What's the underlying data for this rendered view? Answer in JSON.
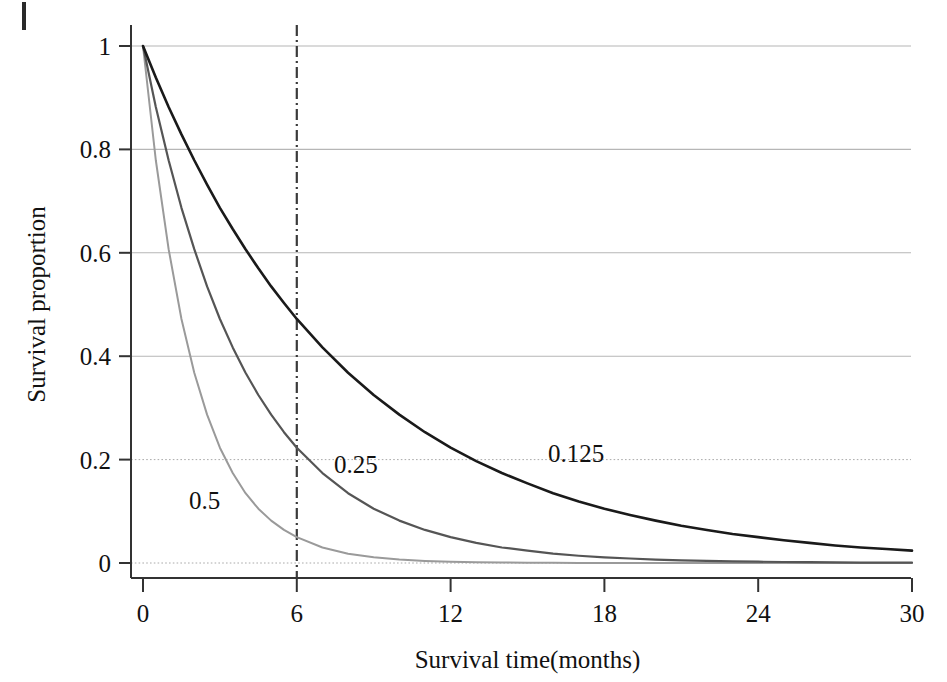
{
  "figure": {
    "artifact_name": "page-edge-mark"
  },
  "chart_data": {
    "type": "line",
    "title": "",
    "xlabel": "Survival time(months)",
    "ylabel": "Survival proportion",
    "xlim": [
      0,
      30
    ],
    "ylim": [
      0,
      1
    ],
    "grid": true,
    "legend_position": "inline-annotations",
    "x_ticks": [
      "0",
      "6",
      "12",
      "18",
      "24",
      "30"
    ],
    "x_tick_values": [
      0,
      6,
      12,
      18,
      24,
      30
    ],
    "y_ticks": [
      "0",
      "0.2",
      "0.4",
      "0.6",
      "0.8",
      "1"
    ],
    "y_tick_values": [
      0,
      0.2,
      0.4,
      0.6,
      0.8,
      1
    ],
    "gridline_styles": {
      "1": "solid",
      "0.8": "solid",
      "0.6": "solid",
      "0.4": "solid",
      "0.2": "dotted",
      "0": "dotted"
    },
    "annotations": [
      {
        "text": "0.5",
        "x": 2.4,
        "y": 0.105,
        "name": "curve-label-0-5"
      },
      {
        "text": "0.25",
        "x": 8.3,
        "y": 0.175,
        "name": "curve-label-0-25"
      },
      {
        "text": "0.125",
        "x": 16.9,
        "y": 0.195,
        "name": "curve-label-0-125"
      }
    ],
    "reference_lines": [
      {
        "name": "vertical-reference-line-month-6",
        "orientation": "vertical",
        "x": 6,
        "style": "dash-dot",
        "color": "#3a3a3a"
      }
    ],
    "x": [
      0,
      0.5,
      1,
      1.5,
      2,
      2.5,
      3,
      3.5,
      4,
      4.5,
      5,
      5.5,
      6,
      7,
      8,
      9,
      10,
      11,
      12,
      13,
      14,
      15,
      16,
      17,
      18,
      19,
      20,
      21,
      22,
      23,
      24,
      25,
      26,
      27,
      28,
      29,
      30
    ],
    "series": [
      {
        "name": "0.5",
        "label": "0.5",
        "hazard_rate": 0.5,
        "color": "#9a9a9a",
        "line_width": 2,
        "values": [
          1,
          0.779,
          0.607,
          0.472,
          0.368,
          0.287,
          0.223,
          0.174,
          0.135,
          0.105,
          0.082,
          0.064,
          0.05,
          0.03,
          0.018,
          0.011,
          0.0067,
          0.0041,
          0.0025,
          0.0015,
          0.0009,
          0.0006,
          0.0003,
          0.0002,
          0.0001,
          0.0001,
          5e-05,
          3e-05,
          2e-05,
          1e-05,
          6e-06,
          4e-06,
          2e-06,
          1e-06,
          8e-07,
          5e-07,
          3e-07
        ]
      },
      {
        "name": "0.25",
        "label": "0.25",
        "hazard_rate": 0.25,
        "color": "#555555",
        "line_width": 2.2,
        "values": [
          1,
          0.882,
          0.779,
          0.687,
          0.607,
          0.535,
          0.472,
          0.417,
          0.368,
          0.325,
          0.287,
          0.253,
          0.223,
          0.174,
          0.135,
          0.105,
          0.082,
          0.064,
          0.05,
          0.039,
          0.03,
          0.024,
          0.018,
          0.014,
          0.011,
          0.0087,
          0.0067,
          0.0052,
          0.0041,
          0.0032,
          0.0025,
          0.0019,
          0.0015,
          0.0012,
          0.0009,
          0.0007,
          0.0006
        ]
      },
      {
        "name": "0.125",
        "label": "0.125",
        "hazard_rate": 0.125,
        "color": "#1a1a1a",
        "line_width": 2.6,
        "values": [
          1,
          0.939,
          0.882,
          0.829,
          0.779,
          0.732,
          0.687,
          0.646,
          0.607,
          0.57,
          0.535,
          0.503,
          0.472,
          0.417,
          0.368,
          0.325,
          0.287,
          0.253,
          0.223,
          0.197,
          0.174,
          0.154,
          0.135,
          0.119,
          0.105,
          0.093,
          0.082,
          0.072,
          0.064,
          0.056,
          0.05,
          0.044,
          0.039,
          0.034,
          0.03,
          0.027,
          0.024
        ]
      }
    ]
  }
}
